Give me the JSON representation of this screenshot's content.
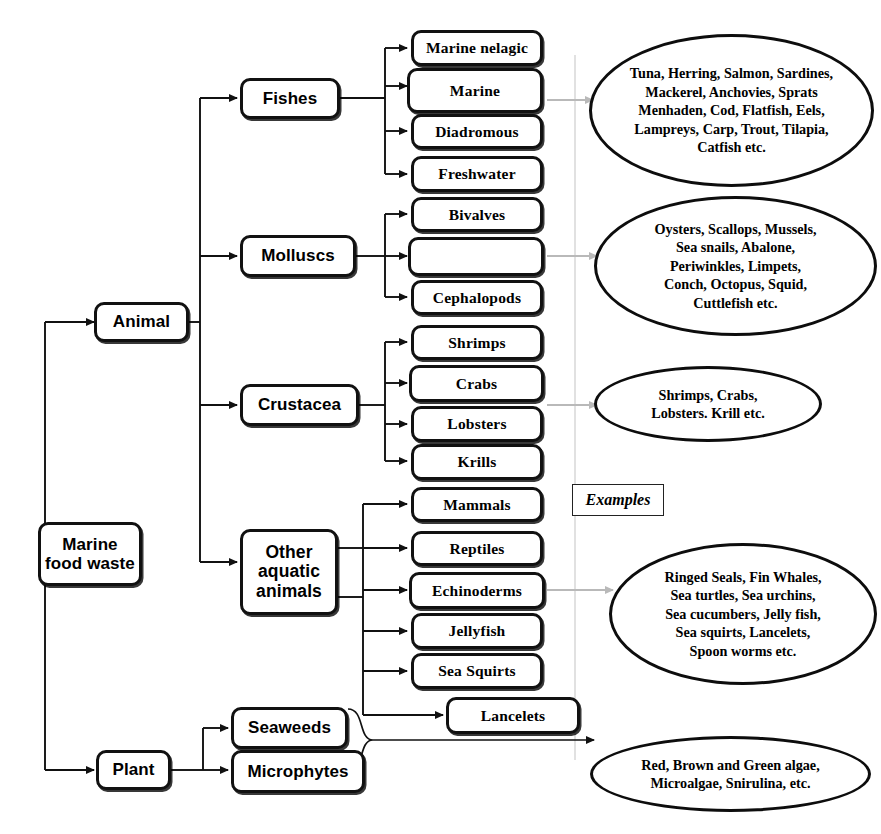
{
  "diagram": {
    "root": {
      "label": "Marine\nfood waste"
    },
    "kingdoms": [
      {
        "id": "animal",
        "label": "Animal"
      },
      {
        "id": "plant",
        "label": "Plant"
      }
    ],
    "groups": [
      {
        "id": "fishes",
        "label": "Fishes"
      },
      {
        "id": "molluscs",
        "label": "Molluscs"
      },
      {
        "id": "crustacea",
        "label": "Crustacea"
      },
      {
        "id": "other",
        "label": "Other\naquatic\nanimals"
      }
    ],
    "plant_groups": [
      {
        "id": "seaweeds",
        "label": "Seaweeds"
      },
      {
        "id": "microphytes",
        "label": "Microphytes"
      }
    ],
    "fish_types": [
      {
        "label": "Marine nelagic"
      },
      {
        "label": "Marine"
      },
      {
        "label": "Diadromous"
      },
      {
        "label": "Freshwater"
      }
    ],
    "mollusc_types": [
      {
        "label": "Bivalves"
      },
      {
        "label": ""
      },
      {
        "label": "Cephalopods"
      }
    ],
    "crustacea_types": [
      {
        "label": "Shrimps"
      },
      {
        "label": "Crabs"
      },
      {
        "label": "Lobsters"
      },
      {
        "label": "Krills"
      }
    ],
    "other_types": [
      {
        "label": "Mammals"
      },
      {
        "label": "Reptiles"
      },
      {
        "label": "Echinoderms"
      },
      {
        "label": "Jellyfish"
      },
      {
        "label": "Sea Squirts"
      },
      {
        "label": "Lancelets"
      }
    ],
    "examples_caption": "Examples",
    "examples": [
      {
        "id": "fish-examples",
        "text": "Tuna, Herring, Salmon, Sardines,\nMackerel, Anchovies, Sprats\nMenhaden, Cod, Flatfish, Eels,\nLampreys, Carp, Trout, Tilapia,\nCatfish etc."
      },
      {
        "id": "mollusc-examples",
        "text": "Oysters, Scallops, Mussels,\nSea snails, Abalone,\nPeriwinkles, Limpets,\nConch, Octopus, Squid,\nCuttlefish etc."
      },
      {
        "id": "crustacea-examples",
        "text": "Shrimps, Crabs,\nLobsters. Krill etc."
      },
      {
        "id": "other-examples",
        "text": "Ringed Seals, Fin Whales,\nSea turtles, Sea urchins,\nSea cucumbers, Jelly fish,\nSea squirts, Lancelets,\nSpoon worms etc."
      },
      {
        "id": "plant-examples",
        "text": "Red, Brown and Green algae,\nMicroalgae, Snirulina, etc."
      }
    ],
    "colors": {
      "stroke": "#111111",
      "background": "#ffffff",
      "example_arrow": "#b9b9b9",
      "divider": "#d4d4d4"
    }
  }
}
